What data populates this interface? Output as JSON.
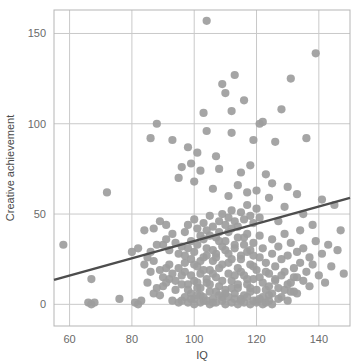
{
  "chart_data": {
    "type": "scatter",
    "title": "",
    "xlabel": "IQ",
    "ylabel": "Creative achievement",
    "xlim": [
      55,
      150
    ],
    "ylim": [
      -12,
      163
    ],
    "xticks": [
      60,
      80,
      100,
      120,
      140
    ],
    "xtick_labels": [
      "60",
      "80",
      "100",
      "120",
      "140"
    ],
    "yticks": [
      0,
      50,
      100,
      150
    ],
    "ytick_labels": [
      "0",
      "50",
      "100",
      "150"
    ],
    "grid": true,
    "legend": "none",
    "marker_color": "#9d9d9d",
    "marker_size": 5,
    "grid_color": "#c9c9c9",
    "border_color": "#b5b5b5",
    "trendline": {
      "type": "linear",
      "color": "#4d4d4d",
      "width": 2.4,
      "x_start": 55,
      "y_start": 13.5,
      "x_end": 150,
      "y_end": 59.0
    },
    "points": [
      [
        104,
        157
      ],
      [
        139,
        139
      ],
      [
        131,
        125
      ],
      [
        113,
        127
      ],
      [
        109,
        122
      ],
      [
        110,
        117
      ],
      [
        116,
        113
      ],
      [
        112,
        107
      ],
      [
        103,
        106
      ],
      [
        128,
        108
      ],
      [
        88,
        100
      ],
      [
        86,
        92
      ],
      [
        93,
        91
      ],
      [
        98,
        87
      ],
      [
        101,
        84
      ],
      [
        122,
        101
      ],
      [
        119,
        91
      ],
      [
        121,
        100
      ],
      [
        136,
        92
      ],
      [
        126,
        90
      ],
      [
        104,
        96
      ],
      [
        107,
        82
      ],
      [
        112,
        95
      ],
      [
        99,
        78
      ],
      [
        96,
        76
      ],
      [
        108,
        75
      ],
      [
        102,
        74
      ],
      [
        115,
        73
      ],
      [
        118,
        77
      ],
      [
        123,
        72
      ],
      [
        125,
        67
      ],
      [
        130,
        65
      ],
      [
        133,
        61
      ],
      [
        141,
        58
      ],
      [
        145,
        55
      ],
      [
        147,
        41
      ],
      [
        143,
        33
      ],
      [
        138,
        44
      ],
      [
        135,
        50
      ],
      [
        129,
        54
      ],
      [
        127,
        46
      ],
      [
        124,
        59
      ],
      [
        120,
        63
      ],
      [
        117,
        62
      ],
      [
        114,
        66
      ],
      [
        111,
        60
      ],
      [
        106,
        64
      ],
      [
        100,
        68
      ],
      [
        95,
        70
      ],
      [
        91,
        44
      ],
      [
        89,
        46
      ],
      [
        87,
        42
      ],
      [
        84,
        41
      ],
      [
        82,
        31
      ],
      [
        80,
        29
      ],
      [
        72,
        62
      ],
      [
        58,
        33
      ],
      [
        67,
        14
      ],
      [
        66,
        1
      ],
      [
        67,
        0
      ],
      [
        68,
        1
      ],
      [
        76,
        3
      ],
      [
        81,
        1
      ],
      [
        82,
        0
      ],
      [
        83,
        2
      ],
      [
        85,
        12
      ],
      [
        86,
        18
      ],
      [
        87,
        6
      ],
      [
        88,
        9
      ],
      [
        89,
        5
      ],
      [
        90,
        10
      ],
      [
        91,
        20
      ],
      [
        92,
        14
      ],
      [
        93,
        2
      ],
      [
        94,
        8
      ],
      [
        95,
        1
      ],
      [
        96,
        16
      ],
      [
        97,
        23
      ],
      [
        98,
        11
      ],
      [
        99,
        6
      ],
      [
        100,
        3
      ],
      [
        100,
        13
      ],
      [
        101,
        9
      ],
      [
        101,
        21
      ],
      [
        102,
        17
      ],
      [
        102,
        5
      ],
      [
        103,
        26
      ],
      [
        103,
        2
      ],
      [
        104,
        12
      ],
      [
        104,
        31
      ],
      [
        105,
        7
      ],
      [
        105,
        19
      ],
      [
        106,
        24
      ],
      [
        106,
        1
      ],
      [
        107,
        15
      ],
      [
        107,
        28
      ],
      [
        108,
        10
      ],
      [
        108,
        35
      ],
      [
        109,
        4
      ],
      [
        109,
        22
      ],
      [
        110,
        30
      ],
      [
        110,
        8
      ],
      [
        111,
        17
      ],
      [
        111,
        40
      ],
      [
        112,
        13
      ],
      [
        112,
        25
      ],
      [
        113,
        6
      ],
      [
        113,
        33
      ],
      [
        114,
        20
      ],
      [
        114,
        9
      ],
      [
        115,
        27
      ],
      [
        115,
        3
      ],
      [
        116,
        37
      ],
      [
        116,
        16
      ],
      [
        117,
        11
      ],
      [
        117,
        29
      ],
      [
        118,
        22
      ],
      [
        118,
        7
      ],
      [
        119,
        34
      ],
      [
        119,
        14
      ],
      [
        120,
        19
      ],
      [
        120,
        2
      ],
      [
        121,
        26
      ],
      [
        121,
        38
      ],
      [
        122,
        12
      ],
      [
        122,
        31
      ],
      [
        123,
        8
      ],
      [
        123,
        23
      ],
      [
        124,
        17
      ],
      [
        124,
        5
      ],
      [
        125,
        28
      ],
      [
        125,
        36
      ],
      [
        126,
        14
      ],
      [
        126,
        21
      ],
      [
        127,
        9
      ],
      [
        127,
        32
      ],
      [
        128,
        25
      ],
      [
        128,
        4
      ],
      [
        129,
        18
      ],
      [
        129,
        39
      ],
      [
        130,
        11
      ],
      [
        130,
        27
      ],
      [
        131,
        34
      ],
      [
        131,
        7
      ],
      [
        132,
        20
      ],
      [
        132,
        15
      ],
      [
        133,
        29
      ],
      [
        133,
        6
      ],
      [
        134,
        23
      ],
      [
        134,
        41
      ],
      [
        135,
        13
      ],
      [
        135,
        31
      ],
      [
        136,
        18
      ],
      [
        137,
        26
      ],
      [
        137,
        10
      ],
      [
        138,
        22
      ],
      [
        139,
        35
      ],
      [
        140,
        16
      ],
      [
        141,
        28
      ],
      [
        142,
        12
      ],
      [
        144,
        21
      ],
      [
        146,
        30
      ],
      [
        148,
        17
      ],
      [
        97,
        40
      ],
      [
        98,
        44
      ],
      [
        99,
        35
      ],
      [
        100,
        47
      ],
      [
        101,
        42
      ],
      [
        102,
        38
      ],
      [
        103,
        45
      ],
      [
        104,
        41
      ],
      [
        105,
        49
      ],
      [
        106,
        43
      ],
      [
        107,
        37
      ],
      [
        108,
        46
      ],
      [
        109,
        50
      ],
      [
        110,
        44
      ],
      [
        111,
        48
      ],
      [
        112,
        52
      ],
      [
        113,
        46
      ],
      [
        114,
        43
      ],
      [
        115,
        51
      ],
      [
        116,
        47
      ],
      [
        117,
        55
      ],
      [
        118,
        49
      ],
      [
        119,
        45
      ],
      [
        120,
        53
      ],
      [
        121,
        48
      ],
      [
        90,
        33
      ],
      [
        91,
        36
      ],
      [
        92,
        30
      ],
      [
        93,
        39
      ],
      [
        94,
        34
      ],
      [
        95,
        28
      ],
      [
        96,
        32
      ],
      [
        97,
        27
      ],
      [
        98,
        31
      ],
      [
        99,
        25
      ],
      [
        100,
        29
      ],
      [
        101,
        33
      ],
      [
        102,
        24
      ],
      [
        103,
        36
      ],
      [
        104,
        27
      ],
      [
        105,
        38
      ],
      [
        106,
        30
      ],
      [
        107,
        26
      ],
      [
        108,
        40
      ],
      [
        109,
        32
      ],
      [
        110,
        35
      ],
      [
        111,
        28
      ],
      [
        112,
        42
      ],
      [
        113,
        31
      ],
      [
        114,
        37
      ],
      [
        115,
        25
      ],
      [
        116,
        33
      ],
      [
        117,
        39
      ],
      [
        118,
        30
      ],
      [
        119,
        27
      ],
      [
        84,
        22
      ],
      [
        85,
        26
      ],
      [
        86,
        29
      ],
      [
        87,
        24
      ],
      [
        88,
        33
      ],
      [
        89,
        19
      ],
      [
        90,
        15
      ],
      [
        91,
        12
      ],
      [
        92,
        22
      ],
      [
        93,
        17
      ],
      [
        94,
        13
      ],
      [
        95,
        20
      ],
      [
        96,
        11
      ],
      [
        97,
        18
      ],
      [
        98,
        8
      ],
      [
        99,
        16
      ],
      [
        100,
        22
      ],
      [
        101,
        12
      ],
      [
        102,
        9
      ],
      [
        103,
        19
      ],
      [
        104,
        14
      ],
      [
        105,
        11
      ],
      [
        106,
        17
      ],
      [
        107,
        7
      ],
      [
        108,
        20
      ],
      [
        109,
        13
      ],
      [
        110,
        6
      ],
      [
        111,
        23
      ],
      [
        112,
        9
      ],
      [
        113,
        16
      ],
      [
        114,
        11
      ],
      [
        115,
        18
      ],
      [
        116,
        5
      ],
      [
        117,
        14
      ],
      [
        118,
        9
      ],
      [
        119,
        21
      ],
      [
        120,
        8
      ],
      [
        121,
        15
      ],
      [
        122,
        4
      ],
      [
        123,
        18
      ],
      [
        124,
        10
      ],
      [
        125,
        6
      ],
      [
        126,
        13
      ],
      [
        127,
        3
      ],
      [
        128,
        16
      ],
      [
        129,
        8
      ],
      [
        130,
        2
      ],
      [
        131,
        12
      ],
      [
        132,
        7
      ],
      [
        133,
        15
      ],
      [
        96,
        2
      ],
      [
        97,
        4
      ],
      [
        98,
        1
      ],
      [
        99,
        3
      ],
      [
        100,
        0
      ],
      [
        101,
        5
      ],
      [
        102,
        1
      ],
      [
        103,
        4
      ],
      [
        104,
        2
      ],
      [
        105,
        0
      ],
      [
        106,
        3
      ],
      [
        107,
        1
      ],
      [
        108,
        5
      ],
      [
        109,
        2
      ],
      [
        110,
        0
      ],
      [
        111,
        4
      ],
      [
        112,
        1
      ],
      [
        113,
        3
      ],
      [
        114,
        0
      ],
      [
        115,
        2
      ],
      [
        116,
        1
      ],
      [
        117,
        4
      ],
      [
        118,
        0
      ],
      [
        119,
        2
      ],
      [
        120,
        1
      ],
      [
        121,
        3
      ],
      [
        122,
        0
      ],
      [
        123,
        1
      ],
      [
        124,
        2
      ],
      [
        125,
        0
      ]
    ]
  }
}
